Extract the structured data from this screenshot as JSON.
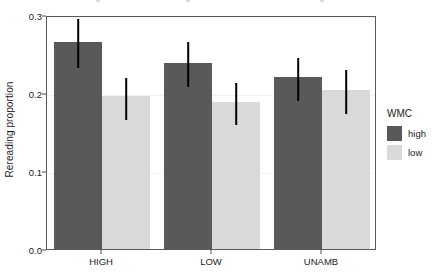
{
  "chart_data": {
    "type": "bar",
    "title": "",
    "subtitle": "",
    "xlabel": "",
    "ylabel": "Rereading proportion",
    "categories": [
      "HIGH",
      "LOW",
      "UNAMB"
    ],
    "ylim": [
      0.0,
      0.3
    ],
    "y_ticks": [
      0.0,
      0.1,
      0.2,
      0.3
    ],
    "y_tick_labels": [
      "0.0",
      "0.1",
      "0.2",
      "0.3"
    ],
    "grid": "horizontal-major-faint",
    "legend_position": "right",
    "legend_title": "WMC",
    "series": [
      {
        "name": "high",
        "color": "#595959",
        "values": [
          0.265,
          0.238,
          0.22
        ],
        "error_low": [
          0.235,
          0.21,
          0.192
        ],
        "error_high": [
          0.298,
          0.268,
          0.248
        ]
      },
      {
        "name": "low",
        "color": "#d9d9d9",
        "values": [
          0.196,
          0.188,
          0.204
        ],
        "error_low": [
          0.168,
          0.161,
          0.175
        ],
        "error_high": [
          0.222,
          0.216,
          0.232
        ]
      }
    ]
  },
  "axes": {
    "y_title": "Rereading proportion",
    "y_tick_labels": [
      "0.3",
      "0.2",
      "0.1",
      "0.0"
    ],
    "x_tick_labels": [
      "HIGH",
      "LOW",
      "UNAMB"
    ]
  },
  "legend": {
    "title": "WMC",
    "items": [
      {
        "label": "high",
        "color": "#595959"
      },
      {
        "label": "low",
        "color": "#d9d9d9"
      }
    ]
  },
  "colors": {
    "high": "#595959",
    "low": "#d9d9d9",
    "panel_border": "#5a5a5a",
    "gridline": "#f2f2f2",
    "errorbar": "#000000",
    "background": "#ffffff"
  }
}
